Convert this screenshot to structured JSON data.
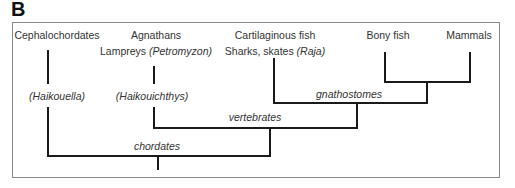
{
  "panel": {
    "label": "B"
  },
  "taxa": {
    "cephalochordates": {
      "group": "Cephalochordates",
      "fossil": "(Haikouella)"
    },
    "agnathans": {
      "group": "Agnathans",
      "example_prefix": "Lampreys ",
      "example_genus": "(Petromyzon)",
      "fossil": "(Haikouichthys)"
    },
    "cartilaginous": {
      "group": "Cartilaginous fish",
      "example_prefix": "Sharks, skates ",
      "example_genus": "(Raja)"
    },
    "bony": {
      "group": "Bony fish"
    },
    "mammals": {
      "group": "Mammals"
    }
  },
  "clades": {
    "gnathostomes": "gnathostomes",
    "vertebrates": "vertebrates",
    "chordates": "chordates"
  },
  "colors": {
    "line": "#1a1a1a",
    "frame": "#8a8a8a",
    "text": "#333333"
  }
}
